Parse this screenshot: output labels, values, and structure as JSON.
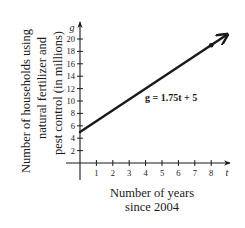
{
  "chart_data": {
    "type": "line",
    "title": "",
    "xlabel": [
      "Number of years",
      "since 2004"
    ],
    "ylabel": [
      "Number of households using",
      "natural fertilizer and",
      "pest control (in millions)"
    ],
    "x_axis_variable": "t",
    "y_axis_variable": "g",
    "x_ticks": [
      1,
      2,
      3,
      4,
      5,
      6,
      7,
      8
    ],
    "y_ticks": [
      2,
      4,
      6,
      8,
      10,
      12,
      14,
      16,
      18,
      20
    ],
    "xlim": [
      0,
      8.9
    ],
    "ylim": [
      0,
      21.5
    ],
    "grid": false,
    "legend": null,
    "series": [
      {
        "name": "g = 1.75t + 5",
        "equation": "g = 1.75t + 5",
        "slope": 1.75,
        "intercept": 5,
        "x": [
          0,
          8
        ],
        "values": [
          5,
          19
        ],
        "marked_points": [
          {
            "t": 8,
            "g": 19
          }
        ],
        "arrow_end": true
      }
    ],
    "annotations": [
      {
        "text": "g = 1.75t + 5",
        "near": {
          "t": 5.5,
          "g": 10
        }
      }
    ],
    "colors": {
      "line": "#1a1a1a",
      "axis": "#1a1a1a",
      "background": "#ffffff"
    }
  }
}
